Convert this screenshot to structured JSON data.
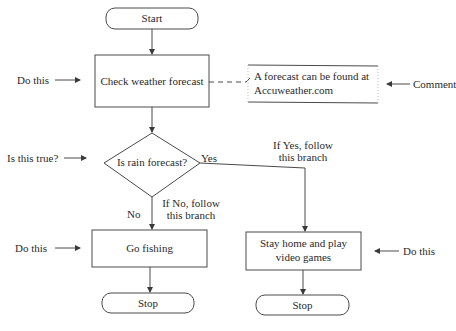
{
  "flowchart": {
    "nodes": {
      "start": {
        "type": "terminator",
        "label": "Start"
      },
      "check_weather": {
        "type": "process",
        "label": "Check weather forecast"
      },
      "comment": {
        "type": "annotation",
        "line1": "A forecast can be found at",
        "line2": "Accuweather.com"
      },
      "decision": {
        "type": "decision",
        "label": "Is rain forecast?"
      },
      "go_fishing": {
        "type": "process",
        "label": "Go fishing"
      },
      "stay_home": {
        "type": "process",
        "line1": "Stay home and play",
        "line2": "video games"
      },
      "stop_left": {
        "type": "terminator",
        "label": "Stop"
      },
      "stop_right": {
        "type": "terminator",
        "label": "Stop"
      }
    },
    "branch_labels": {
      "yes": "Yes",
      "no": "No",
      "yes_note_line1": "If Yes, follow",
      "yes_note_line2": "this branch",
      "no_note_line1": "If No, follow",
      "no_note_line2": "this branch"
    },
    "callouts": {
      "do_this_1": "Do this",
      "is_this_true": "Is this true?",
      "do_this_2": "Do this",
      "do_this_3": "Do this",
      "comment": "Comment"
    },
    "colors": {
      "stroke": "#4a4a4a",
      "text": "#2a2a2a",
      "background": "#ffffff"
    }
  }
}
